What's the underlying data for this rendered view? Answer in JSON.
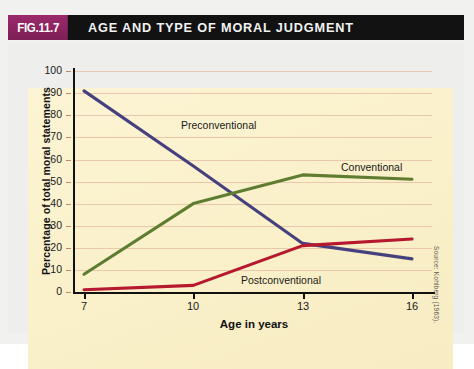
{
  "figure": {
    "number_label": "FIG.11.7",
    "title": "AGE AND TYPE OF MORAL JUDGMENT",
    "source": "Source: Kohlberg (1963)."
  },
  "colors": {
    "header_bg": "#121212",
    "fig_number_bg": "#8e2462",
    "canvas_bg": "#fbf2cf",
    "grid": "#e8bfa6",
    "preconventional": "#46417e",
    "conventional": "#5f7d30",
    "postconventional": "#b5182f"
  },
  "chart_data": {
    "type": "line",
    "title": "AGE AND TYPE OF MORAL JUDGMENT",
    "xlabel": "Age in years",
    "ylabel": "Percentage of total moral statements",
    "x": [
      7,
      10,
      13,
      16
    ],
    "xticks": [
      "7",
      "10",
      "13",
      "16"
    ],
    "xlim": [
      7,
      16
    ],
    "ylim": [
      0,
      100
    ],
    "yticks": [
      "0",
      "10",
      "20",
      "30",
      "40",
      "50",
      "60",
      "70",
      "80",
      "90",
      "100"
    ],
    "grid": true,
    "legend_position": "inline-labels",
    "series": [
      {
        "name": "Preconventional",
        "color": "#46417e",
        "values": [
          91,
          57,
          22,
          15
        ],
        "label_position": "inline"
      },
      {
        "name": "Conventional",
        "color": "#5f7d30",
        "values": [
          8,
          40,
          53,
          51
        ],
        "label_position": "inline"
      },
      {
        "name": "Postconventional",
        "color": "#b5182f",
        "values": [
          1,
          3,
          21,
          24
        ],
        "label_position": "inline"
      }
    ],
    "annotations": [
      {
        "text": "Preconventional",
        "x": 9.1,
        "y": 73
      },
      {
        "text": "Conventional",
        "x": 13.6,
        "y": 58
      },
      {
        "text": "Postconventional",
        "x": 11.4,
        "y": 7
      }
    ]
  }
}
